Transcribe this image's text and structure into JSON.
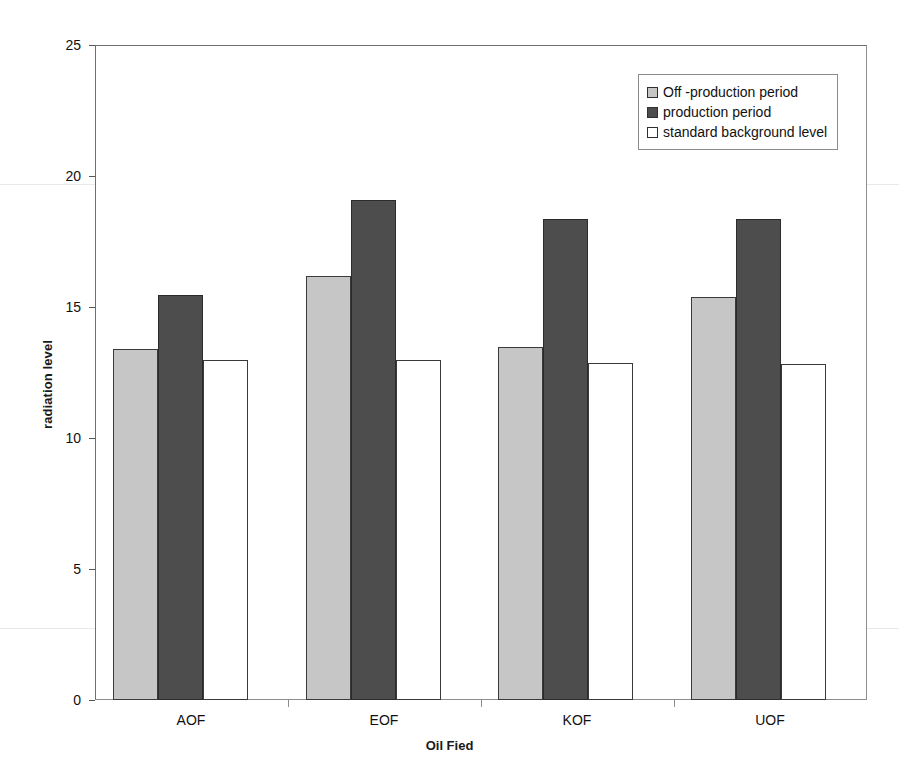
{
  "chart_data": {
    "type": "bar",
    "title": "",
    "xlabel": "Oil Fied",
    "ylabel": "radiation level",
    "categories": [
      "AOF",
      "EOF",
      "KOF",
      "UOF"
    ],
    "ylim": [
      0,
      25
    ],
    "yticks": [
      0,
      5,
      10,
      15,
      20,
      25
    ],
    "grid": false,
    "legend_position": "top-right",
    "series": [
      {
        "name": "Off -production period",
        "color": "#c6c6c6",
        "values": [
          13.4,
          16.2,
          13.5,
          15.4
        ]
      },
      {
        "name": "production period",
        "color": "#4d4d4d",
        "values": [
          15.5,
          19.1,
          18.4,
          18.4
        ]
      },
      {
        "name": "standard background level",
        "color": "#ffffff",
        "values": [
          13.0,
          13.0,
          12.9,
          12.85
        ]
      }
    ]
  },
  "axes": {
    "y_tick_labels": [
      "25",
      "20",
      "15",
      "10",
      "5",
      "0"
    ],
    "y_axis_title": "radiation level",
    "x_tick_labels": [
      "AOF",
      "EOF",
      "KOF",
      "UOF"
    ],
    "x_axis_title": "Oil Fied"
  },
  "legend": {
    "items": [
      {
        "label": "Off -production period",
        "swatch": "light-gray-swatch"
      },
      {
        "label": "production period",
        "swatch": "dark-gray-swatch"
      },
      {
        "label": "standard background level",
        "swatch": "white-swatch"
      }
    ]
  },
  "colors": {
    "series_off_production": "#c6c6c6",
    "series_production": "#4d4d4d",
    "series_background": "#ffffff",
    "axis": "#8e8e8e",
    "text": "#111111"
  }
}
